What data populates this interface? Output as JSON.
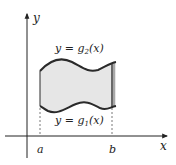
{
  "diagram": {
    "axes": {
      "x_label": "x",
      "y_label": "y"
    },
    "ticks": {
      "a_label": "a",
      "b_label": "b"
    },
    "curves": {
      "upper_label": "y = g",
      "upper_sub": "2",
      "upper_tail": "(x)",
      "lower_label": "y = g",
      "lower_sub": "1",
      "lower_tail": "(x)"
    },
    "colors": {
      "fill": "#e6e6e6",
      "edge_fill": "#a8a8a8",
      "stroke": "#2a2a2a",
      "axis": "#222222"
    }
  }
}
